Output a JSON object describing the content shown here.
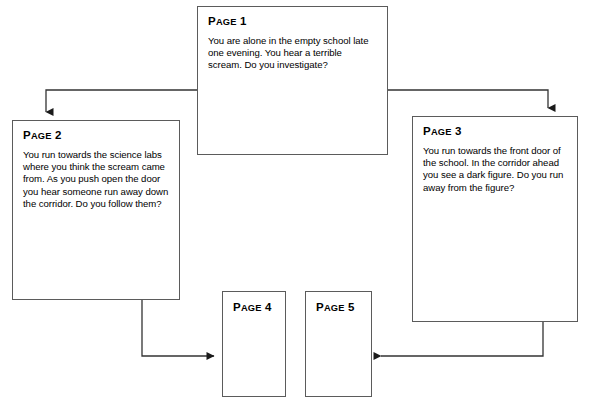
{
  "diagram": {
    "type": "flowchart",
    "title_visible": false,
    "background_color": "#ffffff",
    "box_border_color": "#5b5b5b",
    "choice_box_color": "#000000",
    "choice_text_color": "#ffffff",
    "connector_color": "#333333"
  },
  "nodes": [
    {
      "id": "page1",
      "title_cap": "P",
      "title_rest": "AGE",
      "title_num": "1",
      "title": "PAGE 1",
      "text": "You are alone in the empty school late one evening. You hear a terrible scream. Do you investigate?",
      "choices": [
        {
          "answer": "YES",
          "goto_cap": "G",
          "goto_rest": "O TO",
          "page_cap": "P",
          "page_rest": "AGE",
          "page_num": "2",
          "goto_full": "GO TO PAGE 2"
        },
        {
          "answer": "NO",
          "goto_cap": "G",
          "goto_rest": "O TO",
          "page_cap": "P",
          "page_rest": "AGE",
          "page_num": "3",
          "goto_full": "GO TO PAGE 3"
        }
      ]
    },
    {
      "id": "page2",
      "title_cap": "P",
      "title_rest": "AGE",
      "title_num": "2",
      "title": "PAGE 2",
      "text": "You run towards the science labs where you think the scream came from. As you push open the door you hear someone run away down the corridor. Do you follow them?",
      "choices": [
        {
          "answer": "YES",
          "goto_cap": "G",
          "goto_rest": "O TO",
          "page_cap": "P",
          "page_rest": "AGE",
          "page_num": "3",
          "goto_full": "GO TO PAGE 3"
        },
        {
          "answer": "NO",
          "goto_cap": "G",
          "goto_rest": "O TO",
          "page_cap": "P",
          "page_rest": "AGE",
          "page_num": "4",
          "goto_full": "GO TO PAGE 4"
        }
      ]
    },
    {
      "id": "page3",
      "title_cap": "P",
      "title_rest": "AGE",
      "title_num": "3",
      "title": "PAGE 3",
      "text": "You run towards the front door of the school. In the corridor ahead you see a dark figure. Do you run away from the figure?",
      "choices": [
        {
          "answer": "YES",
          "goto_cap": "G",
          "goto_rest": "O TO",
          "page_cap": "P",
          "page_rest": "AGE",
          "page_num": "2",
          "goto_full": "GO TO PAGE 2"
        },
        {
          "answer": "NO",
          "goto_cap": "G",
          "goto_rest": "O TO",
          "page_cap": "P",
          "page_rest": "AGE",
          "page_num": "5",
          "goto_full": "GO TO PAGE 5"
        }
      ]
    },
    {
      "id": "page4",
      "title_cap": "P",
      "title_rest": "AGE",
      "title_num": "4",
      "title": "PAGE 4",
      "text": "",
      "choices": []
    },
    {
      "id": "page5",
      "title_cap": "P",
      "title_rest": "AGE",
      "title_num": "5",
      "title": "PAGE 5",
      "text": "",
      "choices": []
    }
  ],
  "edges": [
    {
      "from": "page1.yes",
      "to": "page2",
      "label": ""
    },
    {
      "from": "page1.no",
      "to": "page3",
      "label": ""
    },
    {
      "from": "page2.no",
      "to": "page4",
      "label": ""
    },
    {
      "from": "page3.no",
      "to": "page5",
      "label": ""
    }
  ]
}
